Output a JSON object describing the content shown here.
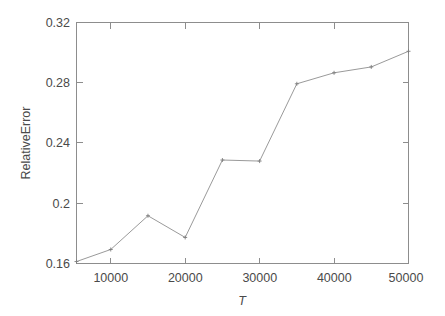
{
  "chart_data": {
    "type": "line",
    "title": "",
    "subtitle": "",
    "xlabel": "T",
    "ylabel": "RelativeError",
    "xlim": [
      5400,
      50000
    ],
    "ylim": [
      0.16,
      0.32
    ],
    "grid": false,
    "legend": null,
    "legend_position": "none",
    "xticks": [
      10000,
      20000,
      30000,
      40000,
      50000
    ],
    "xtick_labels": [
      "10000",
      "20000",
      "30000",
      "40000",
      "50000"
    ],
    "yticks": [
      0.16,
      0.2,
      0.24,
      0.28,
      0.32
    ],
    "ytick_labels": [
      "0.16",
      "0.2",
      "0.24",
      "0.28",
      "0.32"
    ],
    "x": [
      5400,
      10000,
      15000,
      20000,
      25000,
      30000,
      35000,
      40000,
      45000,
      50000
    ],
    "values": [
      0.1613,
      0.1693,
      0.1917,
      0.1773,
      0.2287,
      0.228,
      0.2793,
      0.2866,
      0.2905,
      0.3009
    ],
    "series": [
      {
        "name": "RelativeError",
        "color": "#9a9a9a",
        "marker": "point",
        "values": [
          0.1613,
          0.1693,
          0.1917,
          0.1773,
          0.2287,
          0.228,
          0.2793,
          0.2866,
          0.2905,
          0.3009
        ]
      }
    ]
  },
  "colors": {
    "background": "#ffffff",
    "axis": "#8d8d8d",
    "line": "#9a9a9a",
    "text": "#4a4a4a"
  },
  "axes": {
    "y_title": "RelativeError",
    "x_title": "T",
    "ytick_0": "0.16",
    "ytick_1": "0.2",
    "ytick_2": "0.24",
    "ytick_3": "0.28",
    "ytick_4": "0.32",
    "xtick_0": "10000",
    "xtick_1": "20000",
    "xtick_2": "30000",
    "xtick_3": "40000",
    "xtick_4": "50000"
  }
}
